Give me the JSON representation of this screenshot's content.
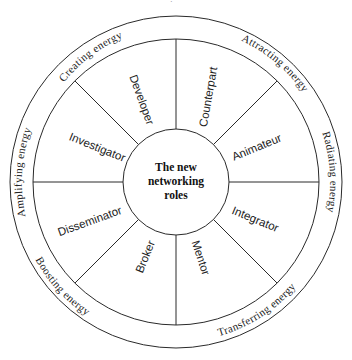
{
  "diagram": {
    "center": {
      "lines": [
        "The new",
        "networking",
        "roles"
      ]
    },
    "roles": [
      {
        "label": "Developer"
      },
      {
        "label": "Counterpart"
      },
      {
        "label": "Animateur"
      },
      {
        "label": "Integrator"
      },
      {
        "label": "Mentor"
      },
      {
        "label": "Broker"
      },
      {
        "label": "Disseminator"
      },
      {
        "label": "Investigator"
      }
    ],
    "energies": [
      {
        "label": "Creating energy"
      },
      {
        "label": "Attracting energy"
      },
      {
        "label": "Radiating energy"
      },
      {
        "label": "Transferring energy"
      },
      {
        "label": "Boosting energy"
      },
      {
        "label": "Amplifying energy"
      }
    ],
    "colors": {
      "line": "#2a2a2a",
      "text": "#222222",
      "background": "#ffffff"
    }
  }
}
